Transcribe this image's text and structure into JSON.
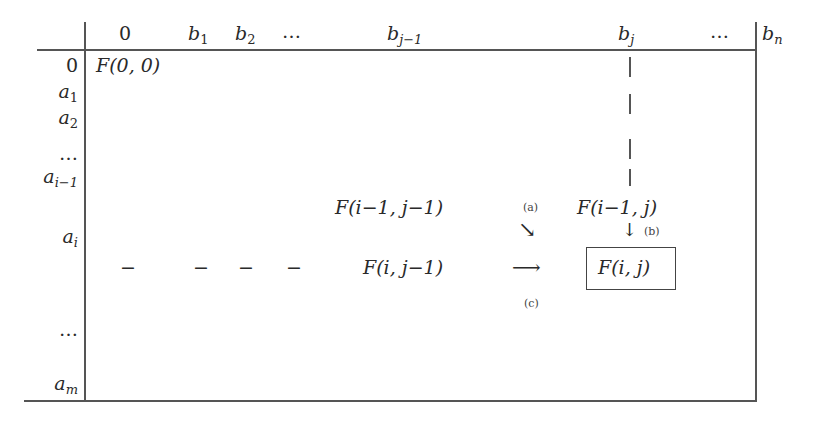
{
  "table": {
    "col_headers": [
      "0",
      "b",
      "b",
      "…",
      "b",
      "b",
      "…",
      "b"
    ],
    "col_subscripts": [
      "",
      "1",
      "2",
      "",
      "j−1",
      "j",
      "",
      "n"
    ],
    "row_headers": [
      "0",
      "a",
      "a",
      "…",
      "a",
      "a",
      "…",
      "a"
    ],
    "row_subscripts": [
      "",
      "1",
      "2",
      "",
      "i−1",
      "i",
      "",
      "m"
    ]
  },
  "cells": {
    "f00": "F(0, 0)",
    "f_im1_jm1": "F(i−1, j−1)",
    "f_im1_j": "F(i−1, j)",
    "f_i_jm1": "F(i, j−1)",
    "f_i_j": "F(i, j)",
    "dash": "−"
  },
  "arrows": {
    "a": {
      "label": "(a)",
      "glyph": "↘"
    },
    "b": {
      "label": "(b)",
      "glyph": "↓"
    },
    "c": {
      "label": "(c)",
      "glyph": "⟶"
    }
  }
}
